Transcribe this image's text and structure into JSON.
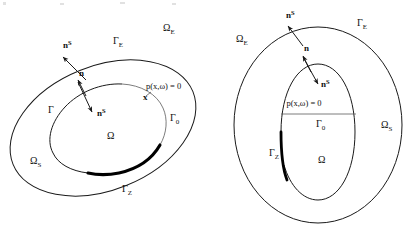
{
  "figure": {
    "background": "#ffffff",
    "ink": "#1a1a1a",
    "accent_thick": "#000000",
    "accent_thin": "#5a5a5a",
    "panels": [
      {
        "id": "left",
        "name": "oblique-ellipses-panel",
        "description": "Two nested rotated ellipses; inner boundary split into a thin arc and a thick arc",
        "labels": [
          {
            "name": "omega-e-label",
            "base": "Ω",
            "sub": "E",
            "sup": "",
            "x": 163,
            "y": 31,
            "kind": "domain"
          },
          {
            "name": "gamma-e-label",
            "base": "Γ",
            "sub": "E",
            "sup": "",
            "x": 113,
            "y": 44,
            "kind": "boundary"
          },
          {
            "name": "n-s-outer-label",
            "base": "n",
            "sub": "",
            "sup": "S",
            "x": 63,
            "y": 48,
            "kind": "normal-vector"
          },
          {
            "name": "n-inner-label",
            "base": "n",
            "sub": "",
            "sup": "",
            "x": 79,
            "y": 76,
            "kind": "normal-vector"
          },
          {
            "name": "n-s-inner-label",
            "base": "n",
            "sub": "",
            "sup": "S",
            "x": 97,
            "y": 116,
            "kind": "normal-vector"
          },
          {
            "name": "gamma-label",
            "base": "Γ",
            "sub": "",
            "sup": "",
            "x": 48,
            "y": 113,
            "kind": "boundary"
          },
          {
            "name": "omega-label",
            "base": "Ω",
            "sub": "",
            "sup": "",
            "x": 107,
            "y": 139,
            "kind": "domain"
          },
          {
            "name": "omega-s-label",
            "base": "Ω",
            "sub": "S",
            "sup": "",
            "x": 30,
            "y": 164,
            "kind": "domain"
          },
          {
            "name": "gamma-0-label",
            "base": "Γ",
            "sub": "0",
            "sup": "",
            "x": 170,
            "y": 121,
            "kind": "boundary"
          },
          {
            "name": "gamma-z-label",
            "base": "Γ",
            "sub": "Z",
            "sup": "",
            "x": 122,
            "y": 192,
            "kind": "boundary"
          },
          {
            "name": "point-x-label",
            "base": "x",
            "sub": "",
            "sup": "",
            "x": 143,
            "y": 100,
            "kind": "point"
          }
        ],
        "equation": {
          "name": "pressure-equation",
          "text": "p(x,ω) = 0",
          "x": 146,
          "y": 89
        }
      },
      {
        "id": "right",
        "name": "concentric-ellipses-panel",
        "description": "Two nested axis-aligned ellipses; inner ellipse cut by a horizontal interface line with a thick arc on its left flank",
        "labels": [
          {
            "name": "omega-e-label",
            "base": "Ω",
            "sub": "E",
            "sup": "",
            "x": 236,
            "y": 42,
            "kind": "domain"
          },
          {
            "name": "gamma-e-label",
            "base": "Γ",
            "sub": "E",
            "sup": "",
            "x": 357,
            "y": 26,
            "kind": "boundary"
          },
          {
            "name": "n-s-outer-label",
            "base": "n",
            "sub": "",
            "sup": "S",
            "x": 286,
            "y": 18,
            "kind": "normal-vector"
          },
          {
            "name": "n-inner-label",
            "base": "n",
            "sub": "",
            "sup": "",
            "x": 304,
            "y": 51,
            "kind": "normal-vector"
          },
          {
            "name": "n-s-inner-label",
            "base": "n",
            "sub": "",
            "sup": "S",
            "x": 321,
            "y": 87,
            "kind": "normal-vector"
          },
          {
            "name": "gamma-0-label",
            "base": "Γ",
            "sub": "0",
            "sup": "",
            "x": 316,
            "y": 127,
            "kind": "boundary"
          },
          {
            "name": "omega-s-label",
            "base": "Ω",
            "sub": "S",
            "sup": "",
            "x": 381,
            "y": 128,
            "kind": "domain"
          },
          {
            "name": "gamma-z-label",
            "base": "Γ",
            "sub": "Z",
            "sup": "",
            "x": 269,
            "y": 156,
            "kind": "boundary"
          },
          {
            "name": "omega-label",
            "base": "Ω",
            "sub": "",
            "sup": "",
            "x": 318,
            "y": 163,
            "kind": "domain"
          }
        ],
        "equation": {
          "name": "pressure-equation",
          "text": "p(x,ω) = 0",
          "x": 304,
          "y": 106
        }
      }
    ]
  }
}
